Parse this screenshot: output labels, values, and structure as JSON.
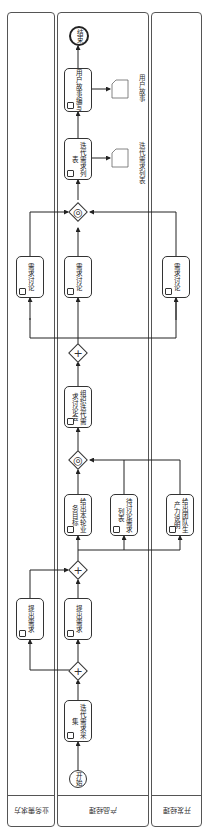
{
  "diagram": {
    "type": "bpmn-swimlane",
    "orientation": "rotated-90",
    "lanes": [
      {
        "id": "lane-business",
        "label": "业务需求方"
      },
      {
        "id": "lane-product",
        "label": "产品经理"
      },
      {
        "id": "lane-dev",
        "label": "开发经理"
      }
    ],
    "events": {
      "start": "开始",
      "end": "结束"
    },
    "tasks": {
      "collect": "迭代需求采集",
      "raise_biz": "提出需求",
      "raise_pm": "提出需求",
      "goal": "给出本轮业务目标",
      "pending": "待讨论需求列表",
      "capacity": "给出团队生产力说明",
      "meeting": "组织迭代需求讨论会",
      "discuss_biz": "需求讨论",
      "discuss_pm": "需求讨论",
      "discuss_dev": "需求讨论",
      "iter_list": "迭代需求列表",
      "story": "用户故事编写"
    },
    "artifacts": {
      "iter_list_doc": "迭代需求列表",
      "story_doc": "用户故事"
    }
  }
}
